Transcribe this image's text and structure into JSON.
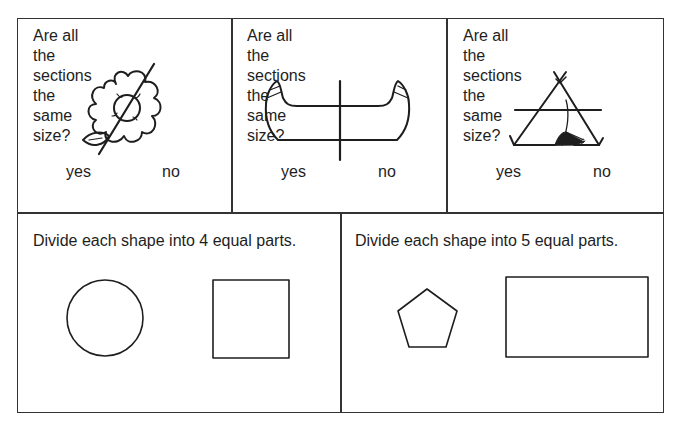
{
  "worksheet": {
    "questions": [
      {
        "prompt": "Are all the sections the\nsame size?",
        "picture": "flower-icon",
        "answers": [
          "yes",
          "no"
        ]
      },
      {
        "prompt": "Are all the sections the\nsame size?",
        "picture": "canoe-icon",
        "answers": [
          "yes",
          "no"
        ]
      },
      {
        "prompt": "Are all the sections the\nsame size?",
        "picture": "tent-icon",
        "answers": [
          "yes",
          "no"
        ]
      }
    ],
    "tasks": [
      {
        "instruction": "Divide each shape into 4 equal parts.",
        "shapes": [
          "circle",
          "square"
        ]
      },
      {
        "instruction": "Divide each shape into 5 equal parts.",
        "shapes": [
          "pentagon",
          "rectangle"
        ]
      }
    ],
    "colors": {
      "ink": "#1e1e1e",
      "border": "#333333",
      "paper": "#ffffff"
    }
  }
}
